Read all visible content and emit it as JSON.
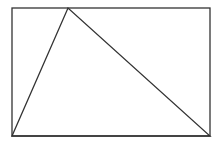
{
  "diagram": {
    "type": "geometry",
    "stroke_color": "#333333",
    "background": "#ffffff",
    "rectangle": {
      "x": 12,
      "y": 8,
      "width": 198,
      "height": 128
    },
    "triangle": {
      "points": [
        [
          12,
          136
        ],
        [
          68,
          8
        ],
        [
          210,
          136
        ]
      ]
    }
  }
}
